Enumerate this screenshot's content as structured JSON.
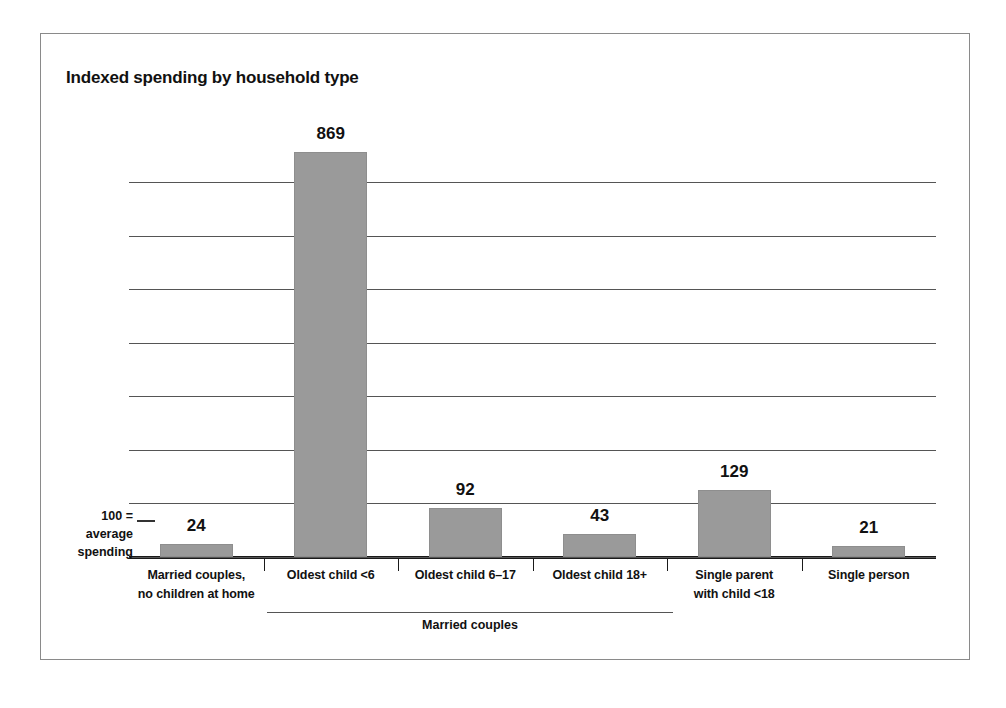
{
  "chart_data": {
    "type": "bar",
    "title": "Indexed spending by household type",
    "xlabel": "",
    "ylabel": "",
    "categories": [
      "Married couples,\nno children at home",
      "Oldest child <6",
      "Oldest child 6–17",
      "Oldest child 18+",
      "Single parent\nwith child <18",
      "Single person"
    ],
    "values": [
      24,
      869,
      92,
      43,
      129,
      21
    ],
    "value_labels": [
      "24",
      "869",
      "92",
      "43",
      "129",
      "21"
    ],
    "reference_line": {
      "value": 100,
      "label_lines": [
        "100 =",
        "average",
        "spending"
      ]
    },
    "group_brackets": [
      {
        "label": "Married couples",
        "covers": [
          "Oldest child <6",
          "Oldest child 6–17",
          "Oldest child 18+"
        ]
      }
    ],
    "grid": true,
    "gridline_count": 8,
    "legend": "none",
    "bar_color": "#9a9a9a",
    "axis_color": "#1a1a1a",
    "grid_color": "#555555",
    "text_color": "#111111",
    "ylim": [
      0,
      900
    ]
  },
  "categories_display": [
    {
      "line1": "Married couples,",
      "line2": "no children at home"
    },
    {
      "line1": "Oldest child <6",
      "line2": ""
    },
    {
      "line1": "Oldest child 6–17",
      "line2": ""
    },
    {
      "line1": "Oldest child 18+",
      "line2": ""
    },
    {
      "line1": "Single parent",
      "line2": "with child <18"
    },
    {
      "line1": "Single person",
      "line2": ""
    }
  ],
  "reference_note": {
    "line1": "100 =",
    "line2": "average",
    "line3": "spending"
  },
  "group_bracket": {
    "label": "Married couples"
  }
}
